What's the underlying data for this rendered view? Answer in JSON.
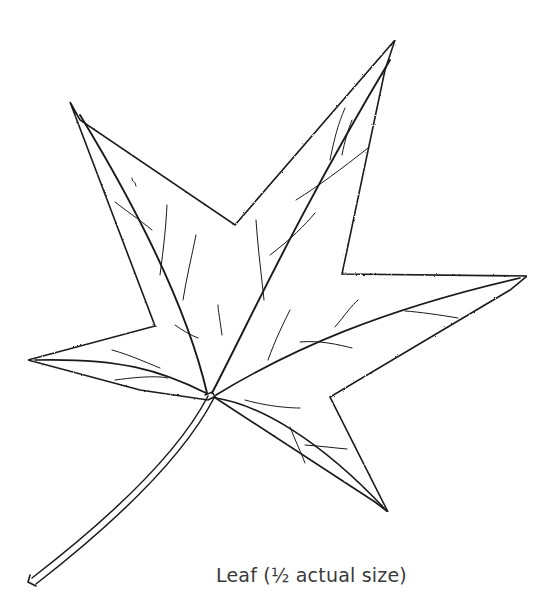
{
  "figure": {
    "caption": "Leaf (½ actual size)",
    "line_color": "#1a1a1a",
    "background": "#ffffff"
  }
}
